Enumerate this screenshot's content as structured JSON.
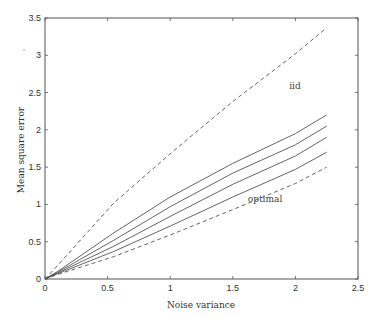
{
  "chart_data": {
    "type": "line",
    "title": "",
    "xlabel": "Noise variance",
    "ylabel": "Mean square error",
    "xlim": [
      0,
      2.5
    ],
    "ylim": [
      0,
      3.5
    ],
    "xticks": [
      0,
      0.5,
      1,
      1.5,
      2,
      2.5
    ],
    "xtick_labels": [
      "0",
      "0.5",
      "1",
      "1.5",
      "2",
      "2.5"
    ],
    "yticks": [
      0,
      0.5,
      1,
      1.5,
      2,
      2.5,
      3,
      3.5
    ],
    "ytick_labels": [
      "0",
      "0.5",
      "1",
      "1.5",
      "2",
      "2.5",
      "3",
      "3.5"
    ],
    "grid": false,
    "legend": "none",
    "series": [
      {
        "name": "iid",
        "style": "dashed",
        "x": [
          0,
          0.1,
          0.55,
          1.0,
          1.5,
          2.0,
          2.25
        ],
        "y": [
          0,
          0.18,
          1.02,
          1.68,
          2.38,
          3.02,
          3.37
        ]
      },
      {
        "name": "solid 1",
        "style": "solid",
        "x": [
          0,
          0.1,
          0.55,
          1.0,
          1.5,
          2.0,
          2.25
        ],
        "y": [
          0,
          0.1,
          0.62,
          1.1,
          1.55,
          1.95,
          2.2
        ]
      },
      {
        "name": "solid 2",
        "style": "solid",
        "x": [
          0,
          0.1,
          0.55,
          1.0,
          1.5,
          2.0,
          2.25
        ],
        "y": [
          0,
          0.09,
          0.52,
          0.97,
          1.42,
          1.8,
          2.05
        ]
      },
      {
        "name": "solid 3",
        "style": "solid",
        "x": [
          0,
          0.1,
          0.55,
          1.0,
          1.5,
          2.0,
          2.25
        ],
        "y": [
          0,
          0.08,
          0.44,
          0.84,
          1.27,
          1.65,
          1.9
        ]
      },
      {
        "name": "solid 4",
        "style": "solid",
        "x": [
          0,
          0.1,
          0.55,
          1.0,
          1.5,
          2.0,
          2.25
        ],
        "y": [
          0,
          0.07,
          0.37,
          0.71,
          1.1,
          1.47,
          1.7
        ]
      },
      {
        "name": "optimal",
        "style": "dashed",
        "x": [
          0,
          0.1,
          0.55,
          1.0,
          1.5,
          2.0,
          2.25
        ],
        "y": [
          0,
          0.06,
          0.3,
          0.59,
          0.93,
          1.28,
          1.5
        ]
      }
    ],
    "annotations": [
      {
        "text": "iid",
        "x": 1.95,
        "y": 2.55
      },
      {
        "text": "optimal",
        "x": 1.62,
        "y": 1.03
      }
    ]
  },
  "colors": {
    "axis": "#555555",
    "line": "#555555",
    "background": "#ffffff"
  }
}
